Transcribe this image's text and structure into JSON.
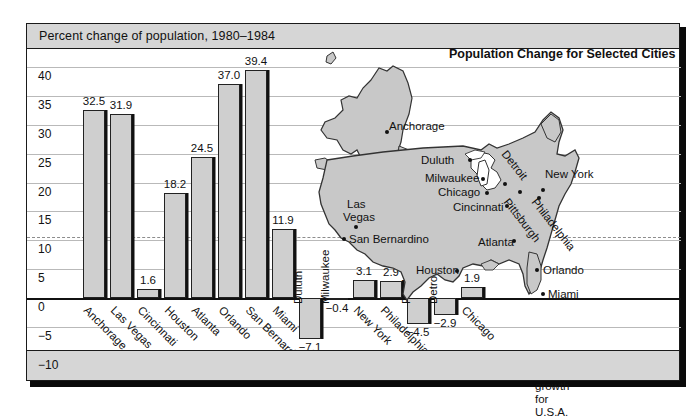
{
  "header": {
    "title": "Percent change of population, 1980–1984"
  },
  "map": {
    "title": "Population Change for Selected Cities",
    "cities": [
      {
        "name": "Anchorage",
        "lx": 76,
        "ly": 82,
        "dx": 72,
        "dy": 92,
        "rot": false
      },
      {
        "name": "Duluth",
        "lx": 108,
        "ly": 116,
        "dx": 155,
        "dy": 120,
        "rot": false
      },
      {
        "name": "Milwaukee",
        "lx": 112,
        "ly": 134,
        "dx": 168,
        "dy": 139,
        "rot": false
      },
      {
        "name": "Chicago",
        "lx": 125,
        "ly": 148,
        "dx": 172,
        "dy": 153,
        "rot": false
      },
      {
        "name": "Cincinnati",
        "lx": 140,
        "ly": 163,
        "dx": 192,
        "dy": 166,
        "rot": false
      },
      {
        "name": "Detroit",
        "lx": 196,
        "ly": 110,
        "dx": 190,
        "dy": 144,
        "rot": true
      },
      {
        "name": "New York",
        "lx": 232,
        "ly": 130,
        "dx": 228,
        "dy": 150,
        "rot": false
      },
      {
        "name": "Pittsburgh",
        "lx": 198,
        "ly": 158,
        "dx": 205,
        "dy": 152,
        "rot": true
      },
      {
        "name": "Philadelphia",
        "lx": 226,
        "ly": 158,
        "dx": 224,
        "dy": 158,
        "rot": true
      },
      {
        "name": "Las",
        "lx": 34,
        "ly": 160,
        "dx": 0,
        "dy": 0,
        "rot": false
      },
      {
        "name": "Vegas",
        "lx": 30,
        "ly": 173,
        "dx": 41,
        "dy": 187,
        "rot": false
      },
      {
        "name": "San Bernardino",
        "lx": 36,
        "ly": 195,
        "dx": 29,
        "dy": 199,
        "rot": false
      },
      {
        "name": "Atlanta",
        "lx": 165,
        "ly": 198,
        "dx": 199,
        "dy": 201,
        "rot": false
      },
      {
        "name": "Houston",
        "lx": 103,
        "ly": 226,
        "dx": 142,
        "dy": 231,
        "rot": false
      },
      {
        "name": "Orlando",
        "lx": 230,
        "ly": 226,
        "dx": 222,
        "dy": 230,
        "rot": false
      },
      {
        "name": "Miami",
        "lx": 235,
        "ly": 250,
        "dx": 228,
        "dy": 254,
        "rot": false
      }
    ]
  },
  "legend": {
    "line1": "average urban",
    "line2": "growth for U.S.A."
  },
  "chart_data": {
    "type": "bar",
    "title": "Percent change of population, 1980–1984",
    "xlabel": "",
    "ylabel": "",
    "ylim": [
      -10,
      40
    ],
    "yticks": [
      40,
      35,
      30,
      25,
      20,
      15,
      10,
      5,
      0,
      -5,
      -10
    ],
    "ytick_labels": [
      "40",
      "35",
      "30",
      "25",
      "20",
      "15",
      "10",
      "5",
      "0",
      "−5",
      "−10"
    ],
    "grid": true,
    "average_urban_growth": 10.5,
    "categories": [
      "Anchorage",
      "Las Vegas",
      "Cincinnati",
      "Houston",
      "Atlanta",
      "Orlando",
      "San Bernardino",
      "Miami",
      "Duluth",
      "Milwaukee",
      "New York",
      "Philadelphia",
      "Pittsburgh",
      "Detroit",
      "Chicago"
    ],
    "values": [
      32.5,
      31.9,
      1.6,
      18.2,
      24.5,
      37.0,
      39.4,
      11.9,
      -7.1,
      -0.4,
      3.1,
      2.9,
      -4.5,
      -2.9,
      1.9
    ],
    "value_labels": [
      "32.5",
      "31.9",
      "1.6",
      "18.2",
      "24.5",
      "37.0",
      "39.4",
      "11.9",
      "−7.1",
      "−0.4",
      "3.1",
      "2.9",
      "−4.5",
      "−2.9",
      "1.9"
    ],
    "label_style": [
      "diag",
      "diag",
      "diag",
      "diag",
      "diag",
      "diag",
      "diag",
      "diag",
      "vert",
      "vert",
      "diag",
      "diag",
      "vert",
      "vert",
      "diag"
    ],
    "bar_x": [
      56,
      83,
      110,
      137,
      164,
      191,
      218,
      245,
      272,
      299,
      326,
      353,
      380,
      407,
      434
    ],
    "bar_w": 22
  }
}
